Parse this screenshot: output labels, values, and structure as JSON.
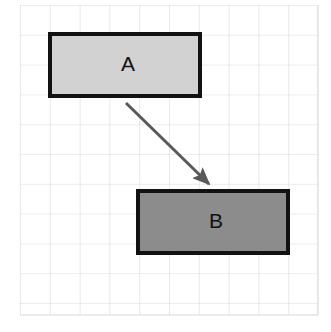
{
  "diagram": {
    "canvas": {
      "width": 331,
      "height": 332,
      "background": "#ffffff"
    },
    "grid": {
      "name": "graph-paper-grid",
      "x": 20,
      "y": 5,
      "width": 298,
      "height": 310,
      "cell_size": 29.8,
      "columns": 10,
      "rows": 10.4,
      "line_color": "#d9d9d9",
      "line_width": 1.2,
      "visible": true
    },
    "shapes": [
      {
        "id": "box-a",
        "label": "A",
        "type": "rectangle",
        "x": 50,
        "y": 34,
        "width": 150,
        "height": 62,
        "fill": "#d2d2d2",
        "stroke": "#121212",
        "stroke_width": 4,
        "label_x": 128,
        "label_y": 65,
        "label_color": "#111111",
        "label_size": 21
      },
      {
        "id": "box-b",
        "label": "B",
        "type": "rectangle",
        "x": 138,
        "y": 191,
        "width": 150,
        "height": 62,
        "fill": "#8c8c8c",
        "stroke": "#121212",
        "stroke_width": 4,
        "label_x": 216,
        "label_y": 222,
        "label_color": "#111111",
        "label_size": 21
      }
    ],
    "connectors": [
      {
        "id": "arrow-a-to-b",
        "from": "box-a",
        "to": "box-b",
        "x1": 126,
        "y1": 103,
        "x2": 209,
        "y2": 184,
        "color": "#595959",
        "stroke_width": 3,
        "arrowhead": "filled-triangle",
        "arrowhead_length": 13,
        "arrowhead_width": 9
      }
    ]
  }
}
